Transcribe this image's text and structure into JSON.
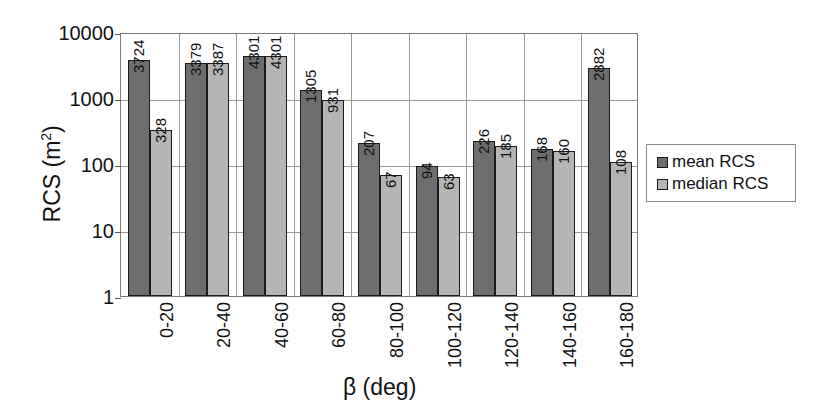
{
  "chart_data": {
    "type": "bar",
    "title": "",
    "xlabel": "β (deg)",
    "ylabel": "RCS (m²)",
    "ylabel_base": "RCS (m",
    "ylabel_sup": "2",
    "ylabel_close": ")",
    "yscale": "log",
    "ylim": [
      1,
      10000
    ],
    "yticks": [
      "1",
      "10",
      "100",
      "1000",
      "10000"
    ],
    "grid": true,
    "legend_position": "right",
    "categories": [
      "0-20",
      "20-40",
      "40-60",
      "60-80",
      "80-100",
      "100-120",
      "120-140",
      "140-160",
      "160-180"
    ],
    "series": [
      {
        "name": "mean RCS",
        "color": "#6e6e6e",
        "values": [
          3724,
          3379,
          4301,
          1305,
          207,
          94,
          226,
          168,
          2882
        ],
        "labels": [
          "3724",
          "3379",
          "4301",
          "1305",
          "207",
          "94",
          "226",
          "168",
          "2882"
        ]
      },
      {
        "name": "median RCS",
        "color": "#b5b5b5",
        "values": [
          328,
          3387,
          4301,
          931,
          67,
          63,
          185,
          160,
          108
        ],
        "labels": [
          "328",
          "3387",
          "4301",
          "931",
          "67",
          "63",
          "185",
          "160",
          "108"
        ]
      }
    ]
  },
  "legend": {
    "items": [
      {
        "label": "mean RCS",
        "color": "#6e6e6e"
      },
      {
        "label": "median RCS",
        "color": "#b5b5b5"
      }
    ]
  },
  "colors": {
    "mean": "#6e6e6e",
    "median": "#b5b5b5",
    "grid": "#9a9a9a",
    "frame": "#7a7a7a",
    "bar_outline": "#1a1a1a",
    "text": "#111111",
    "background": "#ffffff"
  }
}
